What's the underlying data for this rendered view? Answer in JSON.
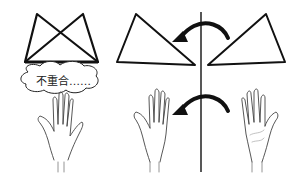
{
  "diagram": {
    "left_panel": {
      "figure": "overlapping-triangles",
      "speech_bubble": {
        "text": "不重合……"
      },
      "hand": "right-hand-back"
    },
    "right_panel": {
      "mirror_axis": "vertical-line",
      "shapes": [
        {
          "name": "triangle-left",
          "position": "left"
        },
        {
          "name": "triangle-right",
          "position": "right"
        }
      ],
      "arrows": [
        {
          "name": "flip-arrow-top",
          "direction": "right-to-left"
        },
        {
          "name": "flip-arrow-bottom",
          "direction": "right-to-left"
        }
      ],
      "hands": [
        {
          "name": "hand-left",
          "view": "back"
        },
        {
          "name": "hand-right",
          "view": "palm"
        }
      ]
    },
    "colors": {
      "stroke": "#111111",
      "background": "#ffffff",
      "sketch": "#555555"
    }
  }
}
